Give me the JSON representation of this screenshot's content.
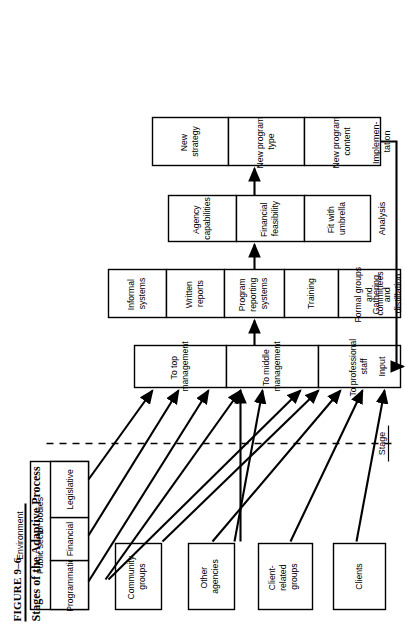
{
  "figure": {
    "number": "FIGURE 9–6",
    "title": "Stages of the Adaptive Process"
  },
  "labels": {
    "environment": "Environment",
    "stage_header": "Stage"
  },
  "stages": [
    {
      "id": "input",
      "label": "Input"
    },
    {
      "id": "gathering",
      "label": "Gathering and distillation"
    },
    {
      "id": "analysis",
      "label": "Analysis"
    },
    {
      "id": "implementation",
      "label": "Implemen- tation"
    }
  ],
  "environment_boxes": [
    {
      "id": "public-sector-bodies",
      "label": "Public sector bodies",
      "children": [
        {
          "id": "programmatic",
          "label": "Programmatic"
        },
        {
          "id": "financial",
          "label": "Financial"
        },
        {
          "id": "legislative",
          "label": "Legislative"
        }
      ]
    },
    {
      "id": "community-groups",
      "label": "Community groups"
    },
    {
      "id": "other-agencies",
      "label": "Other agencies"
    },
    {
      "id": "client-related-groups",
      "label": "Client- related groups"
    },
    {
      "id": "clients",
      "label": "Clients"
    }
  ],
  "input_boxes": [
    {
      "id": "to-top-management",
      "label": "To top management"
    },
    {
      "id": "to-middle-management",
      "label": "To middle management"
    },
    {
      "id": "to-professional-staff",
      "label": "To professional staff"
    }
  ],
  "gathering_boxes": [
    {
      "id": "informal-systems",
      "label": "Informal systems"
    },
    {
      "id": "written-reports",
      "label": "Written reports"
    },
    {
      "id": "program-reporting-systems",
      "label": "Program reporting systems"
    },
    {
      "id": "training",
      "label": "Training"
    },
    {
      "id": "formal-groups-and-committees",
      "label": "Formal groups and committees"
    }
  ],
  "analysis_boxes": [
    {
      "id": "agency-capabilities",
      "label": "Agency capabilities"
    },
    {
      "id": "financial-feasibility",
      "label": "Financial feasibility"
    },
    {
      "id": "fit-with-umbrella",
      "label": "Fit with umbrella"
    }
  ],
  "implementation_boxes": [
    {
      "id": "new-strategy",
      "label": "New strategy"
    },
    {
      "id": "new-program-type",
      "label": "New program type"
    },
    {
      "id": "new-program-content",
      "label": "New program content"
    }
  ],
  "colors": {
    "ink": "#000000",
    "paper": "#ffffff"
  }
}
